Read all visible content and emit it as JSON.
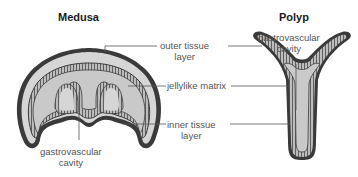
{
  "titles": {
    "medusa": "Medusa",
    "polyp": "Polyp"
  },
  "labels": {
    "outer_tissue": {
      "line1": "outer tissue",
      "line2": "layer"
    },
    "jellylike": {
      "line1": "jellylike matrix"
    },
    "inner_tissue": {
      "line1": "inner tissue",
      "line2": "layer"
    },
    "medusa_cavity": {
      "line1": "gastrovascular",
      "line2": "cavity"
    },
    "polyp_cavity": {
      "line1": "gastrovascular",
      "line2": "cavity"
    }
  },
  "colors": {
    "outline": "#3a3a3a",
    "jelly": "#d6d6d6",
    "cavity": "#c9c9c9",
    "tissue_band": "#9a9a9a",
    "leader_line": "#555555",
    "text": "#555555"
  }
}
